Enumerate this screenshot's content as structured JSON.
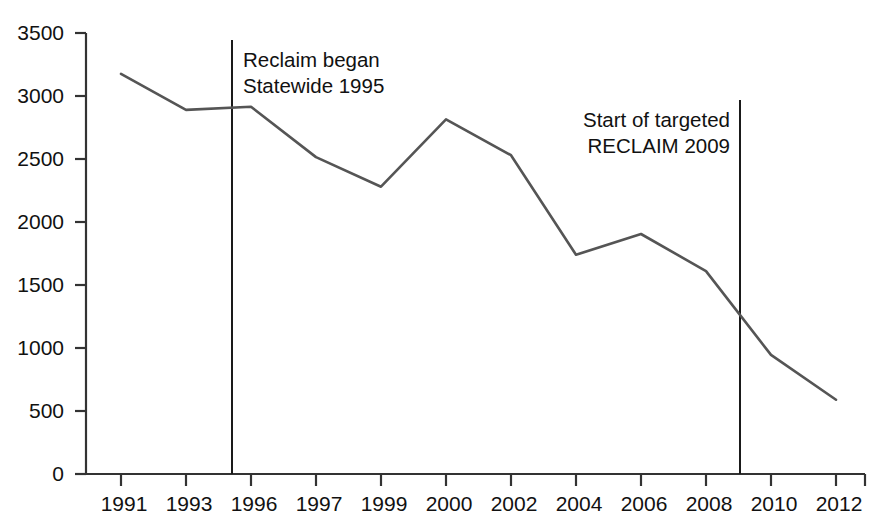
{
  "chart_data": {
    "type": "line",
    "title": "",
    "xlabel": "",
    "ylabel": "",
    "categories": [
      "1991",
      "1993",
      "1996",
      "1997",
      "1999",
      "2000",
      "2002",
      "2004",
      "2006",
      "2008",
      "2010",
      "2012"
    ],
    "values": [
      3175,
      2890,
      2915,
      2515,
      2280,
      2815,
      2530,
      1740,
      1905,
      1610,
      945,
      590
    ],
    "series": [
      {
        "name": "Count",
        "values": [
          3175,
          2890,
          2915,
          2515,
          2280,
          2815,
          2530,
          1740,
          1905,
          1610,
          945,
          590
        ]
      }
    ],
    "ylim": [
      0,
      3500
    ],
    "yticks": [
      0,
      500,
      1000,
      1500,
      2000,
      2500,
      3000,
      3500
    ],
    "ytick_labels": [
      "0",
      "500",
      "1000",
      "1500",
      "2000",
      "2500",
      "3000",
      "3500"
    ],
    "xtick_labels": [
      "1991",
      "1993",
      "1996",
      "1997",
      "1999",
      "2000",
      "2002",
      "2004",
      "2006",
      "2008",
      "2010",
      "2012"
    ],
    "grid": false,
    "legend": "none",
    "line_color": "#555555",
    "axis_color": "#333333",
    "annotations": [
      {
        "id": "reclaim-began",
        "line1": "Reclaim began",
        "line2": "Statewide 1995",
        "vline_at_year": 1995,
        "align": "left"
      },
      {
        "id": "start-targeted-reclaim",
        "line1": "Start of targeted",
        "line2": "RECLAIM 2009",
        "vline_at_year": 2009,
        "align": "right"
      }
    ]
  },
  "axes": {
    "y_ticks": [
      {
        "label": "3500"
      },
      {
        "label": "3000"
      },
      {
        "label": "2500"
      },
      {
        "label": "2000"
      },
      {
        "label": "1500"
      },
      {
        "label": "1000"
      },
      {
        "label": "500"
      },
      {
        "label": "0"
      }
    ],
    "x_ticks": [
      {
        "label": "1991"
      },
      {
        "label": "1993"
      },
      {
        "label": "1996"
      },
      {
        "label": "1997"
      },
      {
        "label": "1999"
      },
      {
        "label": "2000"
      },
      {
        "label": "2002"
      },
      {
        "label": "2004"
      },
      {
        "label": "2006"
      },
      {
        "label": "2008"
      },
      {
        "label": "2010"
      },
      {
        "label": "2012"
      }
    ]
  },
  "annotation_one": {
    "line1": "Reclaim began",
    "line2": "Statewide 1995"
  },
  "annotation_two": {
    "line1": "Start of targeted",
    "line2": "RECLAIM 2009"
  },
  "colors": {
    "line": "#555555",
    "axis": "#333333",
    "text": "#111111",
    "background": "#ffffff"
  }
}
